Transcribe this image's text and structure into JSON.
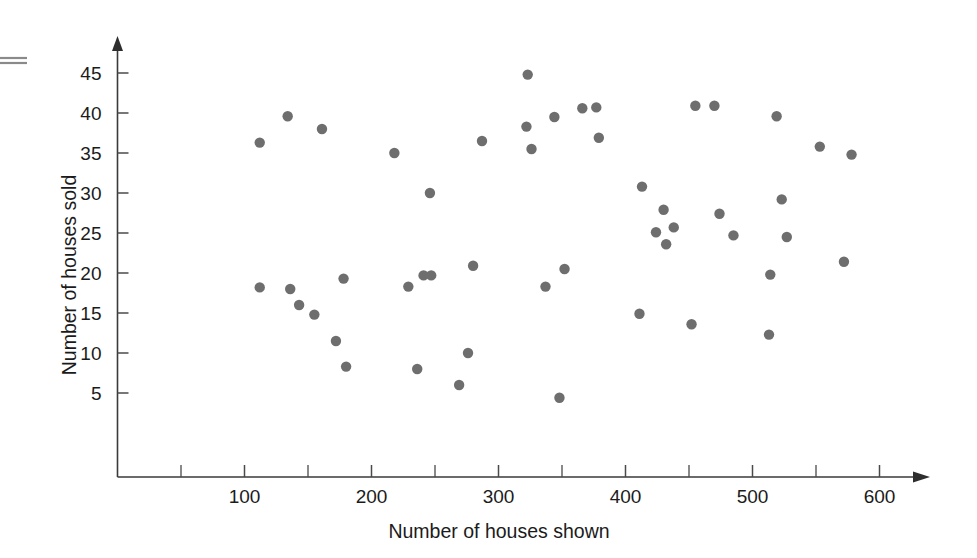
{
  "figure": {
    "background_color": "#ffffff",
    "dot_color": "#6e6e6e",
    "axis_color": "#3a3a3a",
    "text_color": "#1b1b1b"
  },
  "chart_data": {
    "type": "scatter",
    "title": "",
    "xlabel": "Number of houses shown",
    "ylabel": "Number of houses sold",
    "xlim": [
      0,
      640
    ],
    "ylim": [
      0,
      48
    ],
    "grid": false,
    "legend": null,
    "x_ticks_major": [
      100,
      200,
      300,
      400,
      500,
      600
    ],
    "x_tick_labels": [
      "100",
      "200",
      "300",
      "400",
      "500",
      "600"
    ],
    "x_ticks_minor": [
      50,
      150,
      250,
      350,
      450,
      550
    ],
    "y_ticks_major": [
      5,
      10,
      15,
      20,
      25,
      30,
      35,
      40,
      45
    ],
    "y_tick_labels": [
      "5",
      "10",
      "15",
      "20",
      "25",
      "30",
      "35",
      "40",
      "45"
    ],
    "marker": "circle",
    "marker_size": 10,
    "n_points": 58,
    "points": [
      {
        "x": 112,
        "y": 18.2
      },
      {
        "x": 112,
        "y": 36.3
      },
      {
        "x": 134,
        "y": 39.6
      },
      {
        "x": 136,
        "y": 18.0
      },
      {
        "x": 143,
        "y": 16.0
      },
      {
        "x": 155,
        "y": 14.8
      },
      {
        "x": 161,
        "y": 38.0
      },
      {
        "x": 172,
        "y": 11.5
      },
      {
        "x": 178,
        "y": 19.3
      },
      {
        "x": 180,
        "y": 8.3
      },
      {
        "x": 218,
        "y": 35.0
      },
      {
        "x": 229,
        "y": 18.3
      },
      {
        "x": 236,
        "y": 8.0
      },
      {
        "x": 241,
        "y": 19.7
      },
      {
        "x": 247,
        "y": 19.7
      },
      {
        "x": 246,
        "y": 30.0
      },
      {
        "x": 269,
        "y": 6.0
      },
      {
        "x": 276,
        "y": 10.0
      },
      {
        "x": 280,
        "y": 20.9
      },
      {
        "x": 287,
        "y": 36.5
      },
      {
        "x": 322,
        "y": 38.3
      },
      {
        "x": 323,
        "y": 44.8
      },
      {
        "x": 326,
        "y": 35.5
      },
      {
        "x": 337,
        "y": 18.3
      },
      {
        "x": 344,
        "y": 39.5
      },
      {
        "x": 348,
        "y": 4.4
      },
      {
        "x": 352,
        "y": 20.5
      },
      {
        "x": 366,
        "y": 40.6
      },
      {
        "x": 377,
        "y": 40.7
      },
      {
        "x": 379,
        "y": 36.9
      },
      {
        "x": 411,
        "y": 14.9
      },
      {
        "x": 413,
        "y": 30.8
      },
      {
        "x": 424,
        "y": 25.1
      },
      {
        "x": 430,
        "y": 27.9
      },
      {
        "x": 432,
        "y": 23.6
      },
      {
        "x": 438,
        "y": 25.7
      },
      {
        "x": 452,
        "y": 13.6
      },
      {
        "x": 455,
        "y": 40.9
      },
      {
        "x": 470,
        "y": 40.9
      },
      {
        "x": 474,
        "y": 27.4
      },
      {
        "x": 485,
        "y": 24.7
      },
      {
        "x": 513,
        "y": 12.3
      },
      {
        "x": 514,
        "y": 19.8
      },
      {
        "x": 519,
        "y": 39.6
      },
      {
        "x": 523,
        "y": 29.2
      },
      {
        "x": 527,
        "y": 24.5
      },
      {
        "x": 553,
        "y": 35.8
      },
      {
        "x": 572,
        "y": 21.4
      },
      {
        "x": 578,
        "y": 34.8
      }
    ]
  },
  "axis": {
    "y_axis_label": "Number of houses sold",
    "x_axis_label": "Number of houses shown"
  }
}
